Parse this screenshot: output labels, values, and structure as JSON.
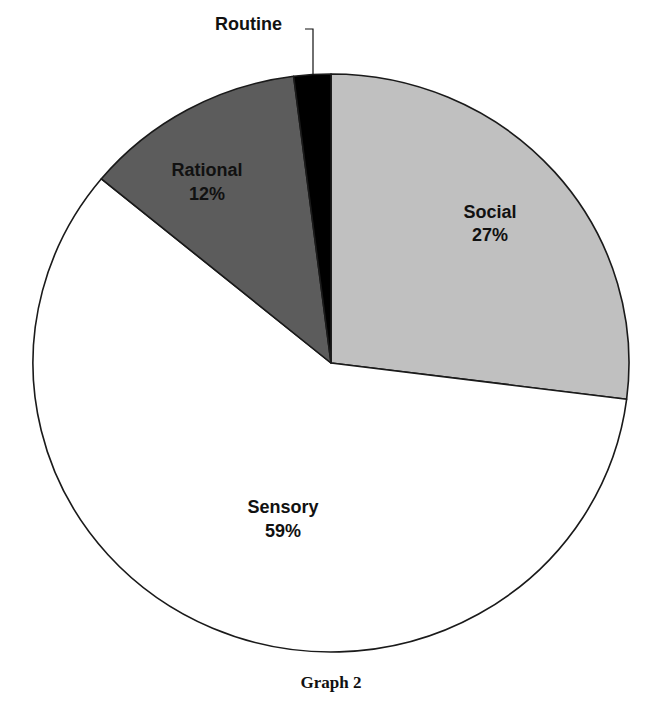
{
  "chart_data": {
    "type": "pie",
    "title": "",
    "caption": "Graph 2",
    "start_angle_deg": 90,
    "direction": "clockwise",
    "slices": [
      {
        "label": "Social",
        "value": 27,
        "value_label": "27%",
        "color": "#c0c0c0"
      },
      {
        "label": "Sensory",
        "value": 59,
        "value_label": "59%",
        "color": "#ffffff"
      },
      {
        "label": "Rational",
        "value": 12,
        "value_label": "12%",
        "color": "#5c5c5c"
      },
      {
        "label": "Routine",
        "value": 2,
        "value_label": "",
        "color": "#000000"
      }
    ],
    "legend": "none (inline labels)",
    "note": "Routine percentage not printed; ~2% estimated from slice size"
  },
  "caption": "Graph 2"
}
